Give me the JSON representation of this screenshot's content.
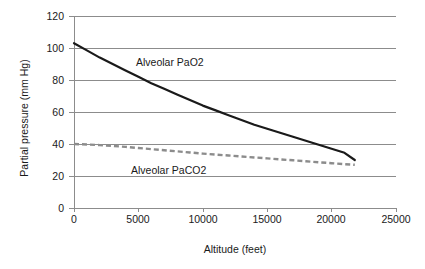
{
  "chart_data": {
    "type": "line",
    "title": "",
    "xlabel": "Altitude (feet)",
    "ylabel": "Partial pressure (mm Hg)",
    "xlim": [
      0,
      25000
    ],
    "ylim": [
      0,
      120
    ],
    "xticks": [
      "0",
      "5000",
      "10000",
      "15000",
      "20000",
      "25000"
    ],
    "xtick_values": [
      0,
      5000,
      10000,
      15000,
      20000,
      25000
    ],
    "yticks": [
      "0",
      "20",
      "40",
      "60",
      "80",
      "100",
      "120"
    ],
    "ytick_values": [
      0,
      20,
      40,
      60,
      80,
      100,
      120
    ],
    "grid": "horizontal",
    "legend": "inline-annotations",
    "series": [
      {
        "name": "Alveolar PaO2",
        "style": "solid",
        "color": "#1a1a1a",
        "annotation": "Alveolar PaO2",
        "x": [
          0,
          1000,
          2000,
          3000,
          4000,
          5000,
          6000,
          7000,
          8000,
          9000,
          10000,
          11000,
          12000,
          13000,
          14000,
          15000,
          16000,
          17000,
          18000,
          19000,
          20000,
          21000,
          21800
        ],
        "values": [
          103,
          98.5,
          94,
          90,
          86,
          82,
          78,
          74.5,
          71,
          67.5,
          64,
          61,
          58,
          55,
          52,
          49.5,
          47,
          44.5,
          42,
          39.5,
          37,
          34.5,
          30
        ]
      },
      {
        "name": "Alveolar PaCO2",
        "style": "dashed",
        "color": "#8c8c8c",
        "annotation": "Alveolar PaCO2",
        "x": [
          0,
          1000,
          2000,
          3000,
          4000,
          5000,
          6000,
          7000,
          8000,
          9000,
          10000,
          11000,
          12000,
          13000,
          14000,
          15000,
          16000,
          17000,
          18000,
          19000,
          20000,
          21000,
          21800
        ],
        "values": [
          40,
          39.7,
          39.3,
          38.8,
          38.2,
          37.5,
          36.8,
          36.1,
          35.4,
          34.7,
          34,
          33.4,
          32.8,
          32.2,
          31.6,
          31,
          30.4,
          29.8,
          29.2,
          28.6,
          28,
          27.4,
          27
        ]
      }
    ]
  },
  "axes": {
    "x_title": "Altitude (feet)",
    "y_title": "Partial pressure (mm Hg)"
  },
  "colors": {
    "pao2": "#1a1a1a",
    "paco2": "#8c8c8c",
    "grid": "#8c8c8c",
    "background": "#ffffff"
  }
}
